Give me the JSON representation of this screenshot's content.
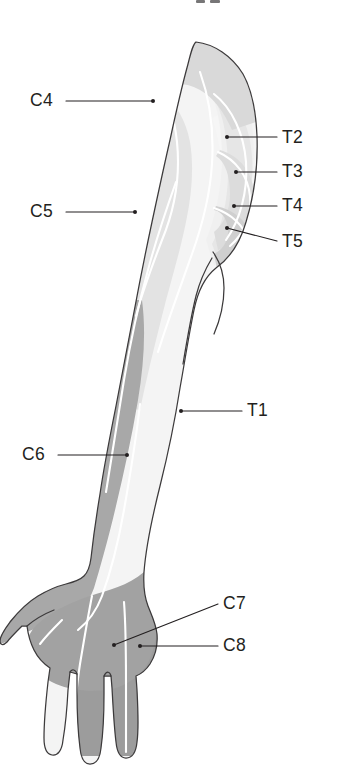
{
  "figure": {
    "title_fragment_visible": "",
    "view": "anterior view of right arm and hand",
    "background_color": "#ffffff",
    "outline_color": "#3c3a3b",
    "divider_color": "#ffffff"
  },
  "palette": {
    "c4_fill": "#d9d9d9",
    "c5_fill": "#e3e3e3",
    "c6_fill": "#a8a8a8",
    "c7_fill": "#9c9c9c",
    "c8_fill": "#9c9c9c",
    "t1_fill": "#f4f4f4",
    "t2_fill": "#f0f0f0",
    "t3_fill": "#e6e6e6",
    "t4_fill": "#dcdcdc",
    "t5_fill": "#cfcfcf",
    "label_color": "#231f20",
    "leader_color": "#231f20"
  },
  "labels": [
    {
      "id": "c4",
      "text": "C4",
      "side": "left",
      "text_x": 30,
      "text_y": 106,
      "line_x1": 66,
      "line_y1": 101,
      "line_x2": 153,
      "line_y2": 101,
      "dot_x": 153,
      "dot_y": 101
    },
    {
      "id": "c5",
      "text": "C5",
      "side": "left",
      "text_x": 30,
      "text_y": 217,
      "line_x1": 66,
      "line_y1": 212,
      "line_x2": 135,
      "line_y2": 212,
      "dot_x": 135,
      "dot_y": 212
    },
    {
      "id": "c6",
      "text": "C6",
      "side": "left",
      "text_x": 22,
      "text_y": 460,
      "line_x1": 58,
      "line_y1": 455,
      "line_x2": 127,
      "line_y2": 455,
      "dot_x": 127,
      "dot_y": 455
    },
    {
      "id": "c7",
      "text": "C7",
      "side": "right",
      "text_x": 223,
      "text_y": 609,
      "line_x1": 218,
      "line_y1": 604,
      "line_x2": 114,
      "line_y2": 645,
      "dot_x": 114,
      "dot_y": 645
    },
    {
      "id": "c8",
      "text": "C8",
      "side": "right",
      "text_x": 223,
      "text_y": 651,
      "line_x1": 218,
      "line_y1": 646,
      "line_x2": 140,
      "line_y2": 646,
      "dot_x": 140,
      "dot_y": 646
    },
    {
      "id": "t1",
      "text": "T1",
      "side": "right",
      "text_x": 247,
      "text_y": 416,
      "line_x1": 242,
      "line_y1": 411,
      "line_x2": 181,
      "line_y2": 411,
      "dot_x": 181,
      "dot_y": 411
    },
    {
      "id": "t2",
      "text": "T2",
      "side": "right",
      "text_x": 282,
      "text_y": 143,
      "line_x1": 277,
      "line_y1": 137,
      "line_x2": 227,
      "line_y2": 137,
      "dot_x": 227,
      "dot_y": 137
    },
    {
      "id": "t3",
      "text": "T3",
      "side": "right",
      "text_x": 282,
      "text_y": 177,
      "line_x1": 277,
      "line_y1": 172,
      "line_x2": 236,
      "line_y2": 172,
      "dot_x": 236,
      "dot_y": 172
    },
    {
      "id": "t4",
      "text": "T4",
      "side": "right",
      "text_x": 282,
      "text_y": 211,
      "line_x1": 277,
      "line_y1": 206,
      "line_x2": 234,
      "line_y2": 206,
      "dot_x": 234,
      "dot_y": 206
    },
    {
      "id": "t5",
      "text": "T5",
      "side": "right",
      "text_x": 282,
      "text_y": 247,
      "line_x1": 277,
      "line_y1": 241,
      "line_x2": 227,
      "line_y2": 228,
      "dot_x": 227,
      "dot_y": 228
    }
  ],
  "regions": [
    {
      "id": "c4",
      "label": "C4",
      "description": "shoulder cap / supraclavicular region"
    },
    {
      "id": "c5",
      "label": "C5",
      "description": "lateral upper arm"
    },
    {
      "id": "c6",
      "label": "C6",
      "description": "lateral forearm, thumb and radial hand"
    },
    {
      "id": "c7",
      "label": "C7",
      "description": "middle finger and central palm"
    },
    {
      "id": "c8",
      "label": "C8",
      "description": "ulnar hand, ring and little fingers"
    },
    {
      "id": "t1",
      "label": "T1",
      "description": "medial forearm"
    },
    {
      "id": "t2",
      "label": "T2",
      "description": "medial upper arm / axilla"
    },
    {
      "id": "t3",
      "label": "T3",
      "description": "chest wall band below axilla"
    },
    {
      "id": "t4",
      "label": "T4",
      "description": "chest wall band"
    },
    {
      "id": "t5",
      "label": "T5",
      "description": "chest wall band"
    }
  ]
}
